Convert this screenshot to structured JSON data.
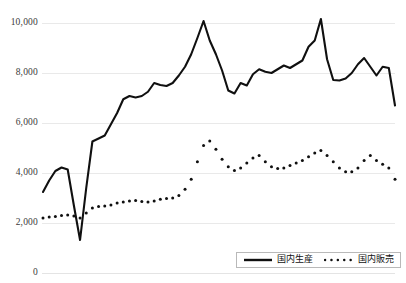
{
  "chart_data": {
    "type": "line",
    "title": "",
    "xlabel": "",
    "ylabel": "",
    "ylim": [
      0,
      10000
    ],
    "grid": true,
    "legend_position": "bottom",
    "yticks": [
      0,
      2000,
      4000,
      6000,
      8000,
      10000
    ],
    "ytick_labels": [
      "0",
      "2,000",
      "4,000",
      "6,000",
      "8,000",
      "10,000"
    ],
    "x": [
      1,
      2,
      3,
      4,
      5,
      6,
      7,
      8,
      9,
      10,
      11,
      12,
      13,
      14,
      15,
      16,
      17,
      18,
      19,
      20,
      21,
      22,
      23,
      24,
      25,
      26,
      27,
      28,
      29,
      30,
      31,
      32,
      33,
      34,
      35,
      36,
      37,
      38,
      39,
      40,
      41,
      42,
      43,
      44,
      45,
      46,
      47,
      48,
      49,
      50,
      51,
      52,
      53,
      54,
      55,
      56,
      57,
      58
    ],
    "series": [
      {
        "name": "国内生産",
        "style": "solid",
        "color": "#101010",
        "values": [
          3240,
          3700,
          4080,
          4220,
          4140,
          2700,
          1320,
          3400,
          5260,
          5380,
          5500,
          5950,
          6400,
          6950,
          7080,
          7020,
          7080,
          7250,
          7600,
          7520,
          7480,
          7600,
          7900,
          8250,
          8750,
          9400,
          10080,
          9300,
          8750,
          8100,
          7300,
          7180,
          7600,
          7500,
          7950,
          8150,
          8050,
          8000,
          8150,
          8300,
          8200,
          8350,
          8500,
          9050,
          9300,
          10160,
          8550,
          7720,
          7700,
          7780,
          8000,
          8350,
          8600,
          8250,
          7900,
          8250,
          8200,
          6700
        ]
      },
      {
        "name": "国内販売",
        "style": "dotted",
        "color": "#101010",
        "values": [
          2200,
          2240,
          2260,
          2300,
          2320,
          2280,
          2200,
          2400,
          2600,
          2660,
          2680,
          2720,
          2800,
          2840,
          2880,
          2900,
          2860,
          2840,
          2880,
          2950,
          2980,
          3000,
          3100,
          3350,
          3750,
          4450,
          5100,
          5280,
          4950,
          4550,
          4250,
          4100,
          4200,
          4400,
          4600,
          4700,
          4450,
          4250,
          4180,
          4200,
          4300,
          4400,
          4500,
          4650,
          4800,
          4900,
          4700,
          4450,
          4200,
          4050,
          4050,
          4200,
          4500,
          4700,
          4500,
          4350,
          4200,
          3750
        ]
      }
    ]
  },
  "legend": {
    "items": [
      {
        "label": "国内生産",
        "style": "solid"
      },
      {
        "label": "国内販売",
        "style": "dotted"
      }
    ]
  }
}
